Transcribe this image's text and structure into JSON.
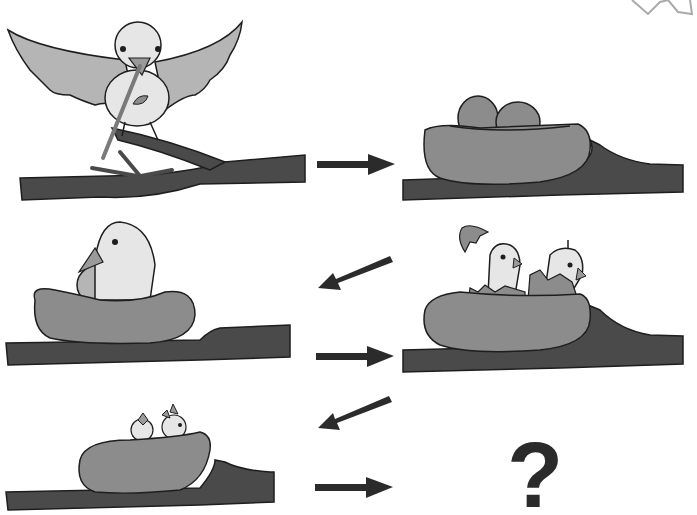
{
  "puzzle": {
    "description": "Bird life cycle sequence",
    "panels": [
      {
        "id": "build-nest",
        "caption": "Bird building nest with twigs on branch"
      },
      {
        "id": "eggs-in-nest",
        "caption": "Two eggs in nest on branch"
      },
      {
        "id": "incubating",
        "caption": "Bird sitting on nest"
      },
      {
        "id": "hatching",
        "caption": "Chicks hatching from eggs in nest"
      },
      {
        "id": "chicks-in-nest",
        "caption": "Two chicks in nest"
      },
      {
        "id": "unknown",
        "caption": "?"
      }
    ],
    "question_mark": "?",
    "arrows": [
      "right",
      "down-left",
      "right",
      "down-left",
      "right"
    ]
  },
  "colors": {
    "branch": "#4a4a4a",
    "nest": "#8c8c8c",
    "bird_body": "#e6e6e6",
    "wing": "#b5b5b5",
    "outline": "#1e1e1e",
    "arrow": "#2b2b2b",
    "star": "#aaaaaa"
  }
}
